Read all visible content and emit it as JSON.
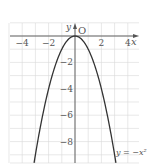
{
  "chart_data": {
    "type": "line",
    "title": "",
    "xlabel": "x",
    "ylabel": "y",
    "origin_label": "O",
    "xlim": [
      -5,
      4.8
    ],
    "ylim": [
      -9.6,
      1
    ],
    "grid": true,
    "x_ticks": [
      -4,
      -2,
      2,
      4
    ],
    "x_tick_labels": [
      "−4",
      "−2",
      "2",
      "4"
    ],
    "y_ticks": [
      -2,
      -4,
      -6,
      -8
    ],
    "y_tick_labels": [
      "−2",
      "−4",
      "−6",
      "−8"
    ],
    "series": [
      {
        "name": "y = −x²",
        "expression": "y=-x^2",
        "x_range": [
          -3.1,
          3.1
        ]
      }
    ],
    "annotations": [
      {
        "text": "y = −x²",
        "position": "bottom-right"
      }
    ],
    "colors": {
      "curve": "#333333",
      "grid": "#d9d9d9",
      "axis": "#555555"
    }
  }
}
